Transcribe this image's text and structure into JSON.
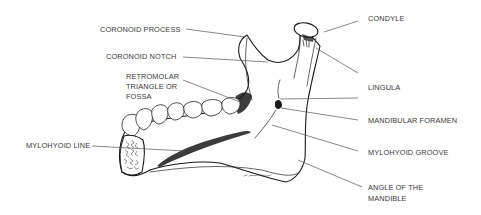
{
  "figure": {
    "labels": {
      "coronoid_process": "CORONOID PROCESS",
      "coronoid_notch": "CORONOID NOTCH",
      "retromolar_line1": "RETROMOLAR",
      "retromolar_line2": "TRIANGLE OR",
      "retromolar_line3": "FOSSA",
      "mylohyoid_line": "MYLOHYOID LINE",
      "condyle": "CONDYLE",
      "lingula": "LINGULA",
      "mandibular_foramen": "MANDIBULAR FORAMEN",
      "mylohyoid_groove": "MYLOHYOID GROOVE",
      "angle_line1": "ANGLE OF THE",
      "angle_line2": "MANDIBLE"
    },
    "colors": {
      "label_text": "#3a3a3a",
      "leader_lines": "#555555",
      "ink": "#1a1a1a",
      "background": "#ffffff"
    }
  }
}
